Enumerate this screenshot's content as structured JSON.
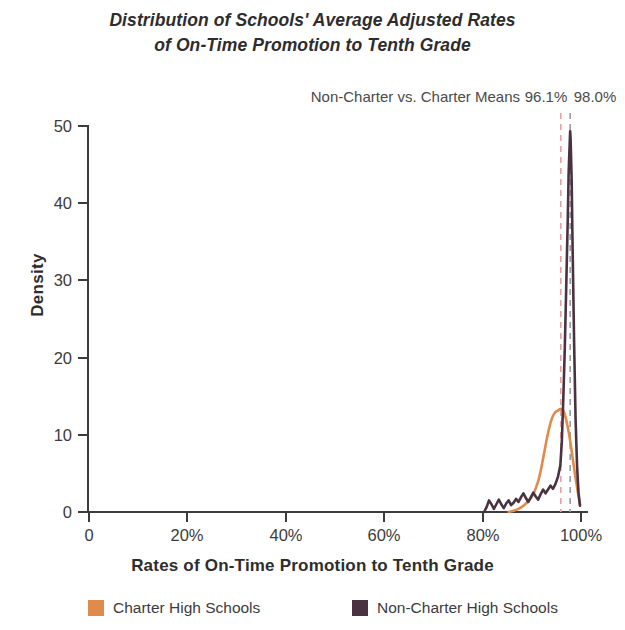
{
  "title": {
    "line1": "Distribution of Schools' Average Adjusted Rates",
    "line2": "of On-Time Promotion to Tenth Grade"
  },
  "annotation": {
    "means_label": "Non-Charter vs. Charter Means",
    "non_charter_mean": "96.1%",
    "charter_mean": "98.0%"
  },
  "axes": {
    "y_title": "Density",
    "x_title": "Rates of On-Time Promotion to Tenth Grade",
    "y_ticks": [
      "0",
      "10",
      "20",
      "30",
      "40",
      "50"
    ],
    "x_ticks": [
      "0",
      "20%",
      "40%",
      "60%",
      "80%",
      "100%"
    ]
  },
  "legend": {
    "charter_label": "Charter High Schools",
    "non_charter_label": "Non-Charter High Schools",
    "charter_color": "#E08A4C",
    "non_charter_color": "#4A3340"
  },
  "chart_data": {
    "type": "line",
    "title": "Distribution of Schools' Average Adjusted Rates of On-Time Promotion to Tenth Grade",
    "xlabel": "Rates of On-Time Promotion to Tenth Grade",
    "ylabel": "Density",
    "xlim": [
      0,
      100
    ],
    "ylim": [
      0,
      50
    ],
    "x_tick_values": [
      0,
      20,
      40,
      60,
      80,
      100
    ],
    "y_tick_values": [
      0,
      10,
      20,
      30,
      40,
      50
    ],
    "grid": false,
    "legend_position": "bottom",
    "annotations": [
      {
        "label": "Non-Charter vs. Charter Means",
        "type": "text"
      },
      {
        "label": "96.1%",
        "type": "vline",
        "x": 96.1,
        "color": "#E8A0A0",
        "style": "dashed",
        "series": "Non-Charter High Schools"
      },
      {
        "label": "98.0%",
        "type": "vline",
        "x": 98.0,
        "color": "#9A9AA2",
        "style": "dashed",
        "series": "Charter High Schools"
      }
    ],
    "series": [
      {
        "name": "Charter High Schools",
        "color": "#E08A4C",
        "mean": 98.0,
        "x": [
          85.5,
          86.5,
          87.5,
          88.5,
          89.5,
          90.5,
          91.5,
          92.0,
          92.5,
          93.0,
          93.5,
          94.0,
          94.5,
          95.0,
          95.5,
          96.0,
          96.5,
          97.0,
          97.5,
          98.0,
          98.5,
          99.0,
          99.5,
          100.0
        ],
        "y": [
          0.0,
          0.15,
          0.4,
          0.8,
          1.4,
          2.3,
          4.0,
          5.3,
          6.9,
          8.6,
          10.2,
          11.5,
          12.4,
          12.9,
          13.1,
          13.3,
          13.2,
          12.4,
          11.0,
          9.2,
          7.0,
          4.8,
          2.8,
          1.0
        ]
      },
      {
        "name": "Non-Charter High Schools",
        "color": "#4A3340",
        "mean": 96.1,
        "x": [
          80.5,
          81.0,
          81.5,
          82.0,
          82.5,
          83.0,
          83.5,
          84.0,
          84.5,
          85.0,
          85.5,
          86.0,
          86.5,
          87.0,
          87.5,
          88.0,
          88.5,
          89.0,
          89.5,
          90.0,
          90.5,
          91.0,
          91.5,
          92.0,
          92.5,
          93.0,
          93.5,
          94.0,
          94.5,
          95.0,
          95.5,
          96.0,
          96.3,
          96.6,
          96.9,
          97.2,
          97.5,
          97.7,
          97.9,
          98.0,
          98.1,
          98.3,
          98.5,
          98.8,
          99.1,
          99.4,
          99.7,
          100.0
        ],
        "y": [
          0.0,
          0.6,
          1.5,
          1.0,
          0.4,
          1.0,
          1.6,
          1.0,
          0.5,
          1.1,
          1.5,
          0.9,
          1.2,
          1.7,
          1.3,
          1.9,
          2.4,
          1.8,
          1.3,
          1.9,
          2.5,
          2.0,
          1.6,
          2.3,
          2.9,
          2.4,
          2.9,
          3.4,
          3.0,
          3.6,
          4.5,
          6.0,
          9.0,
          14.5,
          21.0,
          29.0,
          37.5,
          44.0,
          47.5,
          49.2,
          48.0,
          43.0,
          34.0,
          22.0,
          12.0,
          6.0,
          2.5,
          0.8
        ]
      }
    ]
  }
}
